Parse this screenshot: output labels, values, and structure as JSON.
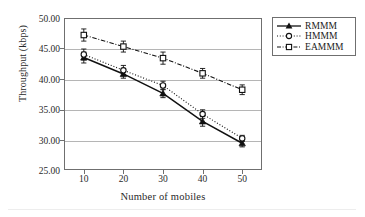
{
  "chart_data": {
    "type": "line",
    "title": "",
    "xlabel": "Number of mobiles",
    "ylabel": "Throughput (kbps)",
    "x": [
      10,
      20,
      30,
      40,
      50
    ],
    "xtick_labels": [
      "10",
      "20",
      "30",
      "40",
      "50"
    ],
    "ytick_labels": [
      "25.00",
      "30.00",
      "35.00",
      "40.00",
      "45.00",
      "50.00"
    ],
    "yticks": [
      25,
      30,
      35,
      40,
      45,
      50
    ],
    "ylim": [
      25,
      50
    ],
    "xlim": [
      5,
      55
    ],
    "grid": "horizontal",
    "legend_position": "outside-top-right",
    "series": [
      {
        "name": "RMMM",
        "marker": "filled-triangle",
        "line_style": "solid",
        "values": [
          43.5,
          40.8,
          37.6,
          33.0,
          29.4
        ],
        "errors": [
          0.9,
          0.7,
          0.7,
          0.8,
          0.6
        ]
      },
      {
        "name": "HMMM",
        "marker": "open-circle",
        "line_style": "dotted",
        "values": [
          44.0,
          41.4,
          38.9,
          34.2,
          30.2
        ],
        "errors": [
          0.9,
          0.8,
          0.7,
          0.7,
          0.5
        ]
      },
      {
        "name": "EAMMM",
        "marker": "open-square",
        "line_style": "dash-dot",
        "values": [
          47.2,
          45.3,
          43.4,
          40.9,
          38.2
        ],
        "errors": [
          1.0,
          0.9,
          1.0,
          0.8,
          0.8
        ]
      }
    ]
  },
  "legend": {
    "entries": [
      {
        "label": "RMMM"
      },
      {
        "label": "HMMM"
      },
      {
        "label": "EAMMM"
      }
    ]
  }
}
